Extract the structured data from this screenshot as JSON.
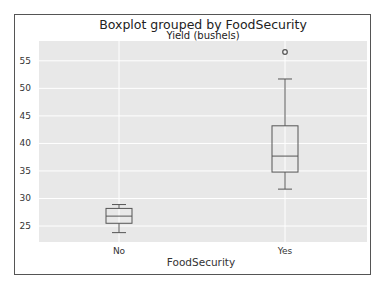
{
  "chart_data": {
    "type": "boxplot",
    "title": "Boxplot grouped by FoodSecurity",
    "subtitle": "Yield (bushels)",
    "xlabel": "FoodSecurity",
    "ylabel": "",
    "categories": [
      "No",
      "Yes"
    ],
    "boxes": [
      {
        "category": "No",
        "whisker_low": 23.8,
        "q1": 25.5,
        "median": 26.8,
        "q3": 28.2,
        "whisker_high": 28.9,
        "outliers": []
      },
      {
        "category": "Yes",
        "whisker_low": 31.7,
        "q1": 34.8,
        "median": 37.7,
        "q3": 43.2,
        "whisker_high": 51.7,
        "outliers": [
          56.6
        ]
      }
    ],
    "yticks": [
      25,
      30,
      35,
      40,
      45,
      50,
      55
    ],
    "ylim": [
      22.1,
      58.6
    ],
    "grid": true,
    "legend": null
  },
  "colors": {
    "plot_background": "#e8e8e8",
    "grid": "#ffffff",
    "box_line": "#555555",
    "frame": "#555555"
  }
}
